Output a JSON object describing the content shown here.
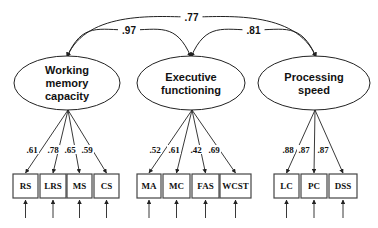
{
  "latents": [
    {
      "id": "wmc",
      "lines": [
        "Working",
        "memory",
        "capacity"
      ],
      "cx": 67,
      "cy": 83,
      "rx": 53,
      "ry": 27
    },
    {
      "id": "ef",
      "lines": [
        "Executive",
        "functioning"
      ],
      "cx": 191,
      "cy": 83,
      "rx": 54,
      "ry": 27
    },
    {
      "id": "ps",
      "lines": [
        "Processing",
        "speed"
      ],
      "cx": 314,
      "cy": 83,
      "rx": 56,
      "ry": 27
    }
  ],
  "correlations": [
    {
      "from": "wmc",
      "to": "ps",
      "value": ".77"
    },
    {
      "from": "wmc",
      "to": "ef",
      "value": ".97"
    },
    {
      "from": "ef",
      "to": "ps",
      "value": ".81"
    }
  ],
  "indicators": [
    {
      "label": "RS",
      "x": 13,
      "w": 25,
      "latent": "wmc",
      "loading": ".61",
      "lx": 32
    },
    {
      "label": "LRS",
      "x": 40,
      "w": 26,
      "latent": "wmc",
      "loading": ".78",
      "lx": 53
    },
    {
      "label": "MS",
      "x": 67,
      "w": 25,
      "latent": "wmc",
      "loading": ".65",
      "lx": 70
    },
    {
      "label": "CS",
      "x": 94,
      "w": 25,
      "latent": "wmc",
      "loading": ".59",
      "lx": 87
    },
    {
      "label": "MA",
      "x": 137,
      "w": 24,
      "latent": "ef",
      "loading": ".52",
      "lx": 155
    },
    {
      "label": "MC",
      "x": 163,
      "w": 27,
      "latent": "ef",
      "loading": ".61",
      "lx": 174
    },
    {
      "label": "FAS",
      "x": 192,
      "w": 27,
      "latent": "ef",
      "loading": ".42",
      "lx": 196
    },
    {
      "label": "WCST",
      "x": 220,
      "w": 31,
      "latent": "ef",
      "loading": ".69",
      "lx": 214
    },
    {
      "label": "LC",
      "x": 274,
      "w": 25,
      "latent": "ps",
      "loading": ".88",
      "lx": 288
    },
    {
      "label": "PC",
      "x": 301,
      "w": 26,
      "latent": "ps",
      "loading": ".87",
      "lx": 304
    },
    {
      "label": "DSS",
      "x": 329,
      "w": 28,
      "latent": "ps",
      "loading": ".87",
      "lx": 323
    }
  ],
  "colors": {
    "stroke": "#222222",
    "box_stroke": "#444444",
    "text": "#111111"
  }
}
